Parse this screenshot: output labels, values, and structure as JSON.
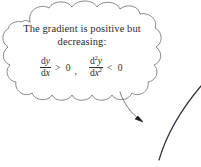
{
  "canvas": {
    "width": 201,
    "height": 167,
    "background": "#ffffff"
  },
  "colors": {
    "text": "#2b2b2b",
    "cloud_outline": "#6b6b6b",
    "arrow": "#5a5a5a",
    "graph_curve": "#2e2e3a",
    "faint_mark": "#9a9a9a"
  },
  "thought_bubble": {
    "name": "thought-cloud",
    "text": {
      "line1": "The gradient is positive but",
      "line2": "decreasing:"
    },
    "formula": {
      "full": "dy/dx > 0, d²y/dx² < 0",
      "first_derivative": {
        "numerator": "dy",
        "denominator": "dx",
        "relation": ">",
        "value": "0"
      },
      "separator": ",",
      "second_derivative": {
        "numerator_d": "d",
        "numerator_exp": "2",
        "numerator_var": "y",
        "denominator_d": "dx",
        "denominator_exp": "2",
        "relation": "<",
        "value": "0"
      }
    }
  },
  "annotations": {
    "pointer_arrow": {
      "name": "curved-arrow",
      "description": "curved arrow from cloud bottom to graph curve"
    },
    "graph_curve": {
      "name": "concave-down-curve",
      "description": "increasing concave-down curve at right edge"
    },
    "top_fragment": {
      "name": "cropped-mark",
      "label": "·"
    }
  }
}
